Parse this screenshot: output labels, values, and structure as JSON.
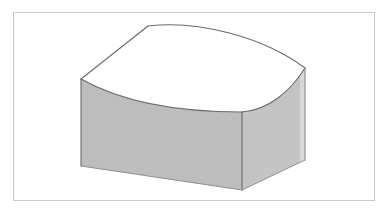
{
  "figure": {
    "title": "Curved-top rectangular solid (isometric technical illustration)",
    "caption": "",
    "description": "A three-dimensional box-like solid drawn in isometric projection whose upper surface is a concave-to-convex curved (saddle / barrel-vault) face. The front-left and right-side vertical faces are shaded mid-gray; the curved top face is white.",
    "background_color": "#ffffff"
  },
  "frame": {
    "name": "image-border",
    "stroke_color": "#c9c9c9",
    "fill_color": "#ffffff",
    "x": 13,
    "y": 12,
    "width": 362,
    "height": 189
  },
  "solid": {
    "projection": "isometric",
    "line_color": "#5a5a5a",
    "line_width": 1,
    "faces": [
      {
        "name": "top-curved-face",
        "label": "Curved top surface",
        "fill_color": "#ffffff",
        "shading": "unshaded"
      },
      {
        "name": "front-left-face",
        "label": "Front-left vertical face",
        "fill_color": "#bdbdbd",
        "shading": "mid-gray"
      },
      {
        "name": "right-side-face",
        "label": "Right vertical face",
        "fill_color": "#c4c4c4",
        "shading": "light-gray"
      },
      {
        "name": "right-edge-highlight",
        "label": "Right edge highlight strip",
        "fill_color": "#d8d8d8",
        "shading": "highlight"
      }
    ],
    "vertices": {
      "left_top": [
        81,
        79
      ],
      "back_left_top": [
        148,
        26
      ],
      "right_top": [
        305,
        68
      ],
      "front_corner_top": [
        242,
        112
      ],
      "left_bottom": [
        81,
        166
      ],
      "front_corner_bottom": [
        242,
        190
      ],
      "right_bottom": [
        305,
        160
      ]
    },
    "edges": [
      {
        "name": "back-left-straight-edge",
        "type": "straight",
        "from": "left_top",
        "to": "back_left_top"
      },
      {
        "name": "back-arch-edge",
        "type": "curve",
        "curvature": "convex-arch",
        "from": "back_left_top",
        "to": "right_top"
      },
      {
        "name": "front-left-sag-edge",
        "type": "curve",
        "curvature": "concave-sag",
        "from": "left_top",
        "to": "front_corner_top"
      },
      {
        "name": "front-right-rise-edge",
        "type": "curve",
        "curvature": "convex",
        "from": "front_corner_top",
        "to": "right_top"
      },
      {
        "name": "left-vertical-edge",
        "type": "straight",
        "from": "left_top",
        "to": "left_bottom"
      },
      {
        "name": "front-vertical-edge",
        "type": "straight",
        "from": "front_corner_top",
        "to": "front_corner_bottom"
      },
      {
        "name": "right-vertical-edge",
        "type": "straight",
        "from": "right_top",
        "to": "right_bottom"
      },
      {
        "name": "bottom-left-edge",
        "type": "straight",
        "from": "left_bottom",
        "to": "front_corner_bottom"
      },
      {
        "name": "bottom-right-edge",
        "type": "straight",
        "from": "front_corner_bottom",
        "to": "right_bottom"
      }
    ]
  }
}
